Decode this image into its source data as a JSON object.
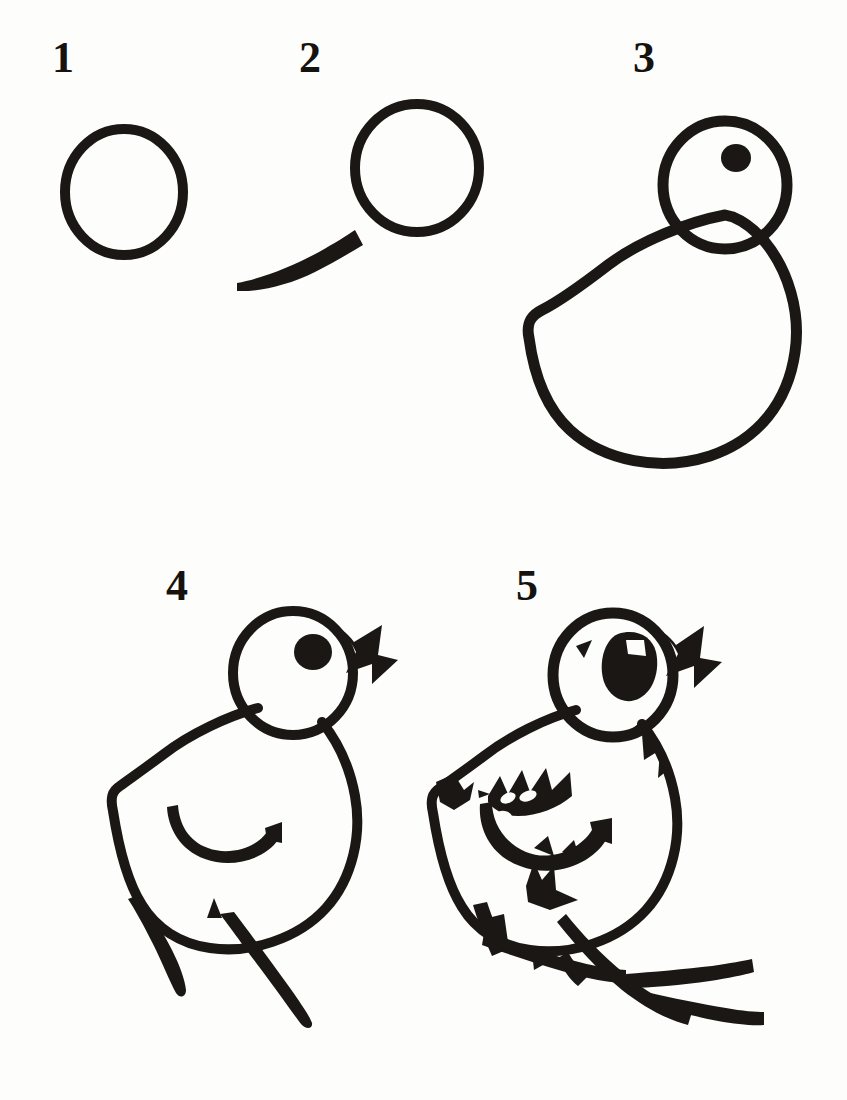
{
  "document": {
    "title": "How to Draw a Chick",
    "subject": "chick",
    "style": "black ink line drawing on white paper",
    "background_color": "#fdfdfc",
    "ink_color": "#1a1714",
    "step_count": 5,
    "layout": "two rows: steps 1-3 on top row, steps 4-5 on bottom row"
  },
  "steps": [
    {
      "number": "1",
      "label_x": 62,
      "label_y": 44,
      "caption": "Draw a circle for the head.",
      "elements": [
        "head-circle"
      ]
    },
    {
      "number": "2",
      "number_x": 306,
      "number_y": 44,
      "caption": "Add a tapered line sweeping down to the left from the circle.",
      "elements": [
        "head-circle",
        "tail-line"
      ]
    },
    {
      "number": "3",
      "number_x": 640,
      "number_y": 44,
      "caption": "Draw the rounded body below the head and add an eye dot.",
      "elements": [
        "head-circle",
        "eye-dot",
        "body-outline"
      ]
    },
    {
      "number": "4",
      "number_x": 175,
      "number_y": 572,
      "caption": "Add the zigzag beak, the wing curve and two legs.",
      "elements": [
        "head-circle",
        "eye-dot",
        "body-outline",
        "beak-zigzag",
        "wing-curve",
        "leg-left",
        "leg-right"
      ]
    },
    {
      "number": "5",
      "number_x": 525,
      "number_y": 572,
      "caption": "Finish with feathered wing, tail spikes, shaped eye and toes.",
      "elements": [
        "head-circle",
        "eye-blob",
        "eye-highlight",
        "brow-tick",
        "beak-zigzag",
        "body-outline",
        "shoulder-spike",
        "neck-spike",
        "wing-feathered",
        "tail-tuft",
        "feet-toes"
      ]
    }
  ],
  "drawing_notes": {
    "head_radius": "about 62 px",
    "stroke_weight": "9–11 px hand-inked line",
    "eye": "solid black dot in step 3 and 4; enlarged rounded blob with white highlight in step 5"
  }
}
